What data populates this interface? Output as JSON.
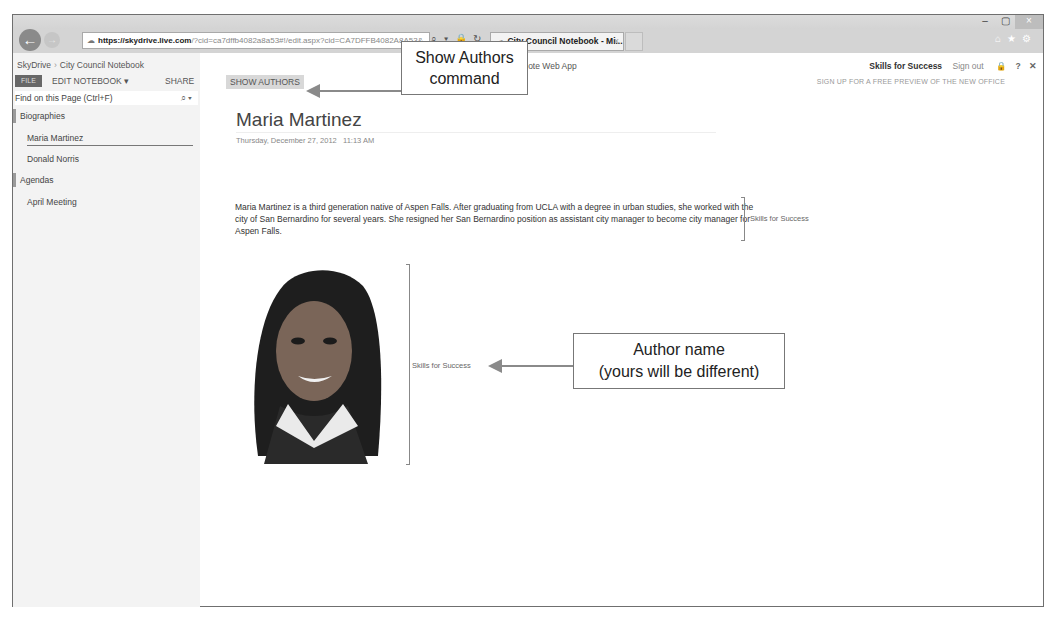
{
  "browser": {
    "url_prefix": "https://",
    "url_domain": "skydrive.live.com",
    "url_rest": "/?cid=ca7dffb4082a8a53#!/edit.aspx?cid=CA7DFFB4082A8A53&",
    "tab_title": "City Council Notebook - Mi...",
    "tab_close": "×",
    "window_controls": {
      "minimize": "–",
      "maximize": "▢",
      "close": "×"
    },
    "toolbar_icons": {
      "home": "⌂",
      "favorites": "★",
      "settings": "⚙"
    },
    "address_icons": "⌕ ▾ 🔒 ↻"
  },
  "app": {
    "breadcrumb": [
      "SkyDrive",
      "City Council Notebook"
    ],
    "breadcrumb_sep": "›",
    "ribbon": {
      "file": "FILE",
      "edit_notebook": "EDIT NOTEBOOK ▾",
      "share": "SHARE",
      "show_authors": "SHOW AUTHORS"
    },
    "product_name": "Note Web App",
    "user_name": "Skills for Success",
    "sign_out": "Sign out",
    "help": "?",
    "close": "✕",
    "promo": "SIGN UP FOR A FREE PREVIEW OF THE NEW OFFICE",
    "find": {
      "placeholder": "Find on this Page (Ctrl+F)",
      "icon": "⌕ ▾"
    },
    "sections": [
      {
        "name": "Biographies",
        "pages": [
          "Maria Martinez",
          "Donald Norris"
        ]
      },
      {
        "name": "Agendas",
        "pages": [
          "April Meeting"
        ]
      }
    ]
  },
  "page": {
    "title": "Maria Martinez",
    "date": "Thursday, December 27, 2012",
    "time": "11:13 AM",
    "paragraph": "Maria Martinez is a third generation native of Aspen Falls. After graduating from UCLA with a degree in urban studies, she worked with the city of San Bernardino for several years. She resigned her San Bernardino position as assistant city manager to become city manager for Aspen Falls.",
    "paragraph_author": "Skills for Success",
    "image_author": "Skills for Success"
  },
  "callouts": {
    "show_authors": {
      "line1": "Show Authors",
      "line2": "command"
    },
    "author_name": {
      "line1": "Author name",
      "line2": "(yours will be different)"
    }
  }
}
